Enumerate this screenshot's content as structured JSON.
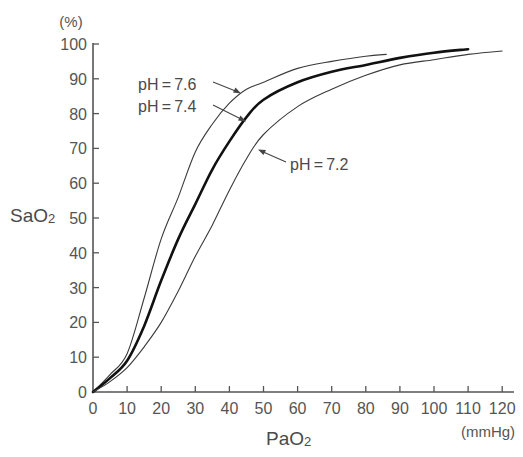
{
  "chart_data": {
    "type": "line",
    "title": "",
    "xlabel": "PaO2",
    "xlabel_main": "PaO",
    "xlabel_sub": "2",
    "x_unit": "(mmHg)",
    "ylabel": "SaO2",
    "ylabel_main": "SaO",
    "ylabel_sub": "2",
    "y_unit": "(%)",
    "xlim": [
      0,
      120
    ],
    "ylim": [
      0,
      100
    ],
    "x_ticks": [
      0,
      10,
      20,
      30,
      40,
      50,
      60,
      70,
      80,
      90,
      100,
      110,
      120
    ],
    "y_ticks": [
      0,
      10,
      20,
      30,
      40,
      50,
      60,
      70,
      80,
      90,
      100
    ],
    "grid": false,
    "legend": "none (direct annotation labels with arrows)",
    "series": [
      {
        "name": "pH = 7.6",
        "label": "pH = 7.6",
        "color": "#3a3a3a",
        "line_width": 1.1,
        "x": [
          0,
          5,
          10,
          15,
          20,
          25,
          30,
          35,
          40,
          45,
          50,
          60,
          70,
          80,
          86
        ],
        "y": [
          0,
          5,
          11,
          27,
          44,
          56,
          69,
          77,
          83,
          87,
          89,
          93,
          95,
          96.5,
          97
        ]
      },
      {
        "name": "pH = 7.4",
        "label": "pH = 7.4",
        "color": "#111111",
        "line_width": 2.6,
        "x": [
          0,
          5,
          10,
          15,
          20,
          25,
          30,
          35,
          40,
          45,
          50,
          60,
          70,
          80,
          90,
          100,
          110
        ],
        "y": [
          0,
          4,
          9,
          19,
          32,
          44,
          54,
          64,
          72,
          79,
          84,
          89,
          92,
          94,
          96,
          97.5,
          98.5
        ]
      },
      {
        "name": "pH = 7.2",
        "label": "pH = 7.2",
        "color": "#3a3a3a",
        "line_width": 1.1,
        "x": [
          0,
          5,
          10,
          15,
          20,
          25,
          30,
          35,
          40,
          45,
          50,
          60,
          70,
          80,
          90,
          100,
          110,
          120
        ],
        "y": [
          0,
          3,
          7,
          13,
          20,
          29,
          39,
          48,
          58,
          67,
          74,
          82,
          87,
          91,
          94,
          95.5,
          97,
          98
        ]
      }
    ],
    "annotations": [
      {
        "text": "pH = 7.6",
        "series": "pH = 7.6",
        "arrow_to": [
          43,
          87.5
        ]
      },
      {
        "text": "pH = 7.4",
        "series": "pH = 7.4",
        "arrow_to": [
          44.5,
          77.5
        ]
      },
      {
        "text": "pH = 7.2",
        "series": "pH = 7.2",
        "arrow_to": [
          48,
          69
        ]
      }
    ]
  }
}
